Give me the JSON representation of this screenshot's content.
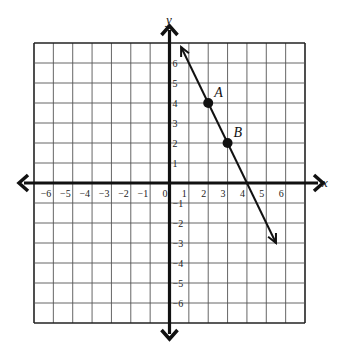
{
  "chart_data": {
    "type": "line",
    "title": "",
    "xlabel": "x",
    "ylabel": "y",
    "xlim": [
      -7,
      7
    ],
    "ylim": [
      -7,
      7
    ],
    "grid": true,
    "x_tick_labels": [
      "-6",
      "-5",
      "-4",
      "-3",
      "-2",
      "-1",
      "0",
      "1",
      "2",
      "3",
      "4",
      "5",
      "6"
    ],
    "y_tick_labels": [
      "6",
      "5",
      "4",
      "3",
      "2",
      "1",
      "-1",
      "-2",
      "-3",
      "-4",
      "-5",
      "-6"
    ],
    "line": {
      "description": "line through A and B with arrows on both ends",
      "slope": -2,
      "intercept": 8,
      "start": [
        0.6,
        6.8
      ],
      "end": [
        5.5,
        -3
      ]
    },
    "points": [
      {
        "label": "A",
        "x": 2,
        "y": 4
      },
      {
        "label": "B",
        "x": 3,
        "y": 2
      }
    ]
  },
  "labels": {
    "x_axis": "x",
    "y_axis": "y",
    "point_a": "A",
    "point_b": "B",
    "origin": "0"
  }
}
